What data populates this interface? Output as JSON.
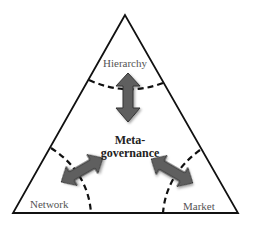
{
  "diagram": {
    "type": "triangle-governance-model",
    "center": {
      "line1": "Meta-",
      "line2": "governance"
    },
    "corners": [
      {
        "id": "top",
        "label": "Hierarchy"
      },
      {
        "id": "bottom-left",
        "label": "Network"
      },
      {
        "id": "bottom-right",
        "label": "Market"
      }
    ],
    "connectors": [
      {
        "from": "Meta-governance",
        "to": "Hierarchy",
        "style": "double-headed-arrow"
      },
      {
        "from": "Meta-governance",
        "to": "Network",
        "style": "double-headed-arrow"
      },
      {
        "from": "Meta-governance",
        "to": "Market",
        "style": "double-headed-arrow"
      }
    ],
    "boundaries": "dashed curves separating each corner region",
    "colors": {
      "outline": "#111111",
      "arrow_fill": "#5f5f5f",
      "arrow_stroke": "#333333",
      "label_text": "#555555",
      "center_text": "#222222"
    }
  }
}
